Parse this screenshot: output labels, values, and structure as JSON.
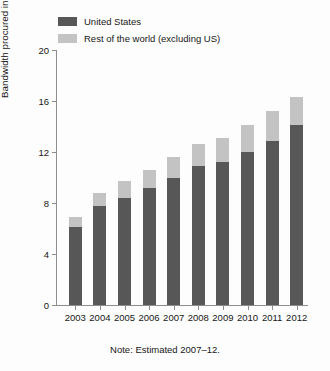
{
  "chart_data": {
    "type": "bar",
    "subtype": "stacked-vertical",
    "title": "",
    "xlabel": "",
    "ylabel": "Bandwidth procured in gigabits per second",
    "ylim": [
      0,
      20
    ],
    "yticks": [
      0,
      4,
      8,
      12,
      16,
      20
    ],
    "ytick_labels": [
      "0",
      "4",
      "8",
      "12",
      "16",
      "20"
    ],
    "grid": false,
    "legend_position": "top-left",
    "categories": [
      "2003",
      "2004",
      "2005",
      "2006",
      "2007",
      "2008",
      "2009",
      "2010",
      "2011",
      "2012"
    ],
    "series": [
      {
        "name": "United States",
        "color": "#575757",
        "values": [
          6.1,
          7.8,
          8.4,
          9.2,
          10.0,
          10.9,
          11.2,
          12.0,
          12.9,
          14.1
        ]
      },
      {
        "name": "Rest of the world (excluding US)",
        "color": "#c3c3c3",
        "values": [
          0.8,
          1.0,
          1.3,
          1.4,
          1.6,
          1.7,
          1.9,
          2.1,
          2.3,
          2.2
        ]
      }
    ],
    "totals": [
      6.9,
      8.8,
      9.7,
      10.6,
      11.6,
      12.6,
      13.1,
      14.1,
      15.2,
      16.3
    ],
    "annotations": [
      "Note: Estimated 2007–12."
    ]
  },
  "legend": {
    "items": [
      {
        "label": "United States",
        "color": "#575757"
      },
      {
        "label": "Rest of the world (excluding US)",
        "color": "#c3c3c3"
      }
    ]
  },
  "note": "Note: Estimated 2007–12."
}
